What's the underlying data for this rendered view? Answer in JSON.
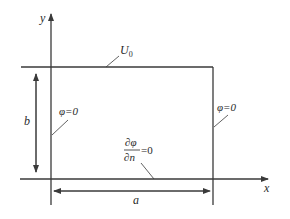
{
  "figure": {
    "type": "boundary-value-problem-rectangle",
    "axes": {
      "x_label": "x",
      "y_label": "y"
    },
    "dimensions": {
      "width_label": "a",
      "height_label": "b"
    },
    "boundary_conditions": {
      "top": {
        "symbol": "U",
        "subscript": "0"
      },
      "left": {
        "text": "φ=0"
      },
      "right": {
        "text": "φ=0"
      },
      "bottom": {
        "numerator": "∂φ",
        "denominator": "∂n",
        "rhs": "=0"
      }
    },
    "colors": {
      "line": "#3a3a3a",
      "text": "#2a2a2a",
      "background": "#ffffff"
    }
  }
}
